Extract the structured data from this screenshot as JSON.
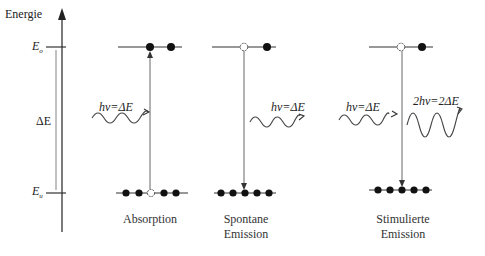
{
  "axis": {
    "title": "Energie",
    "upper_level": "E",
    "upper_level_sub": "o",
    "lower_level": "E",
    "lower_level_sub": "u",
    "gap_label": "ΔE"
  },
  "panels": [
    {
      "name": "absorption",
      "caption_line1": "Absorption",
      "caption_line2": "",
      "photon_in": "hν=ΔE",
      "photon_out": ""
    },
    {
      "name": "spontane-emission",
      "caption_line1": "Spontane",
      "caption_line2": "Emission",
      "photon_in": "",
      "photon_out": "hν=ΔE"
    },
    {
      "name": "stimulierte-emission",
      "caption_line1": "Stimulierte",
      "caption_line2": "Emission",
      "photon_in": "hν=ΔE",
      "photon_out": "2hν=2ΔE"
    }
  ],
  "colors": {
    "line": "#333333",
    "dot": "#111111",
    "arrow": "#555555"
  }
}
